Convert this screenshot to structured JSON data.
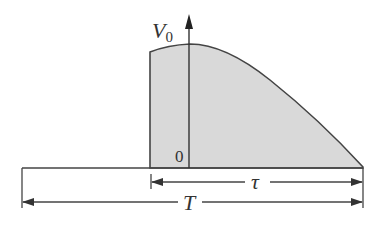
{
  "diagram": {
    "type": "pulse-waveform",
    "axis": {
      "y_label": "V",
      "y_label_subscript": "0",
      "origin_label": "0"
    },
    "dimensions": {
      "pulse_width_label": "τ",
      "period_label": "T"
    },
    "colors": {
      "fill": "#d9d9d9",
      "stroke": "#444444",
      "background": "#ffffff"
    }
  }
}
